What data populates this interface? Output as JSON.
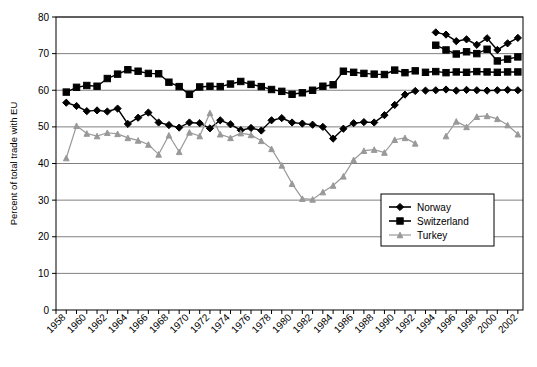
{
  "chart_data": {
    "type": "line",
    "title": "",
    "xlabel": "",
    "ylabel": "Percent of total trade with EU",
    "xlim": [
      1957,
      2002.5
    ],
    "ylim": [
      0,
      80
    ],
    "ytick_step": 10,
    "yticks": [
      0,
      10,
      20,
      30,
      40,
      50,
      60,
      70,
      80
    ],
    "xticks": [
      1958,
      1960,
      1962,
      1964,
      1966,
      1968,
      1970,
      1972,
      1974,
      1976,
      1978,
      1980,
      1982,
      1984,
      1986,
      1988,
      1990,
      1992,
      1994,
      1996,
      1998,
      2000,
      2002
    ],
    "xtick_minor_step": 1,
    "grid": "horizontal",
    "legend_position": "bottom-right",
    "series": [
      {
        "name": "Norway",
        "color": "#000000",
        "marker": "diamond",
        "segments": [
          {
            "x": [
              1958,
              1959,
              1960,
              1961,
              1962,
              1963,
              1964,
              1965,
              1966,
              1967,
              1968,
              1969,
              1970,
              1971,
              1972,
              1973,
              1974,
              1975,
              1976,
              1977,
              1978,
              1979,
              1980,
              1981,
              1982,
              1983,
              1984,
              1985,
              1986,
              1987,
              1988,
              1989,
              1990,
              1991,
              1992
            ],
            "y": [
              56.6,
              55.7,
              54.3,
              54.5,
              54.2,
              55.0,
              50.8,
              52.5,
              53.9,
              51.2,
              50.5,
              49.8,
              51.2,
              51.0,
              49.6,
              51.8,
              50.7,
              49.1,
              49.7,
              49.0,
              51.8,
              52.4,
              51.2,
              50.9,
              50.6,
              50.0,
              46.8,
              49.5,
              51.0,
              51.3,
              51.2,
              53.2,
              56.0,
              58.8,
              59.8
            ]
          },
          {
            "x": [
              1993,
              1994,
              1995,
              1996,
              1997,
              1998,
              1999,
              2000,
              2001,
              2002
            ],
            "y": [
              59.9,
              60.0,
              60.2,
              59.9,
              60.1,
              60.0,
              59.9,
              60.0,
              60.1,
              60.0
            ]
          },
          {
            "x": [
              1994,
              1995,
              1996,
              1997,
              1998,
              1999,
              2000,
              2001,
              2002
            ],
            "y": [
              75.8,
              75.2,
              73.4,
              73.9,
              72.4,
              74.2,
              71.0,
              72.8,
              74.3
            ]
          }
        ]
      },
      {
        "name": "Switzerland",
        "color": "#000000",
        "marker": "square",
        "segments": [
          {
            "x": [
              1958,
              1959,
              1960,
              1961,
              1962,
              1963,
              1964,
              1965,
              1966,
              1967,
              1968,
              1969,
              1970,
              1971,
              1972,
              1973,
              1974,
              1975,
              1976,
              1977,
              1978,
              1979,
              1980,
              1981,
              1982,
              1983,
              1984,
              1985,
              1986,
              1987,
              1988,
              1989,
              1990,
              1991,
              1992
            ],
            "y": [
              59.5,
              60.8,
              61.3,
              61.1,
              63.2,
              64.4,
              65.6,
              65.2,
              64.6,
              64.5,
              62.2,
              61.0,
              58.9,
              60.9,
              61.1,
              61.0,
              61.7,
              62.4,
              61.6,
              61.0,
              60.2,
              59.7,
              58.9,
              59.3,
              60.0,
              61.1,
              61.5,
              65.2,
              64.9,
              64.6,
              64.4,
              64.3,
              65.5,
              64.8,
              65.3
            ]
          },
          {
            "x": [
              1993,
              1994,
              1995,
              1996,
              1997,
              1998,
              1999,
              2000,
              2001,
              2002
            ],
            "y": [
              64.9,
              65.1,
              64.8,
              65.0,
              64.9,
              65.1,
              65.0,
              64.9,
              65.0,
              65.0
            ]
          },
          {
            "x": [
              1994,
              1995,
              1996,
              1997,
              1998,
              1999,
              2000,
              2001,
              2002
            ],
            "y": [
              72.3,
              71.0,
              69.9,
              70.5,
              70.0,
              71.2,
              68.0,
              68.5,
              69.1
            ]
          }
        ]
      },
      {
        "name": "Turkey",
        "color": "#999999",
        "marker": "triangle",
        "segments": [
          {
            "x": [
              1958,
              1959,
              1960,
              1961,
              1962,
              1963,
              1964,
              1965,
              1966,
              1967,
              1968,
              1969,
              1970,
              1971,
              1972,
              1973,
              1974,
              1975,
              1976,
              1977,
              1978,
              1979,
              1980,
              1981,
              1982,
              1983,
              1984,
              1985,
              1986,
              1987,
              1988,
              1989,
              1990,
              1991,
              1992
            ],
            "y": [
              41.5,
              50.3,
              48.2,
              47.5,
              48.4,
              48.1,
              47.0,
              46.3,
              45.2,
              42.5,
              47.7,
              43.2,
              48.5,
              47.5,
              53.8,
              48.0,
              47.0,
              48.3,
              47.8,
              46.2,
              44.0,
              39.5,
              34.5,
              30.4,
              30.2,
              32.2,
              34.0,
              36.5,
              41.0,
              43.5,
              43.8,
              43.0,
              46.5,
              47.0,
              45.5
            ]
          },
          {
            "x": [
              1995,
              1996,
              1997,
              1998,
              1999,
              2000,
              2001,
              2002
            ],
            "y": [
              47.5,
              51.5,
              50.0,
              52.8,
              53.0,
              52.2,
              50.5,
              48.0
            ]
          }
        ]
      }
    ]
  },
  "legend": {
    "entries": [
      {
        "label": "Norway"
      },
      {
        "label": "Switzerland"
      },
      {
        "label": "Turkey"
      }
    ]
  }
}
